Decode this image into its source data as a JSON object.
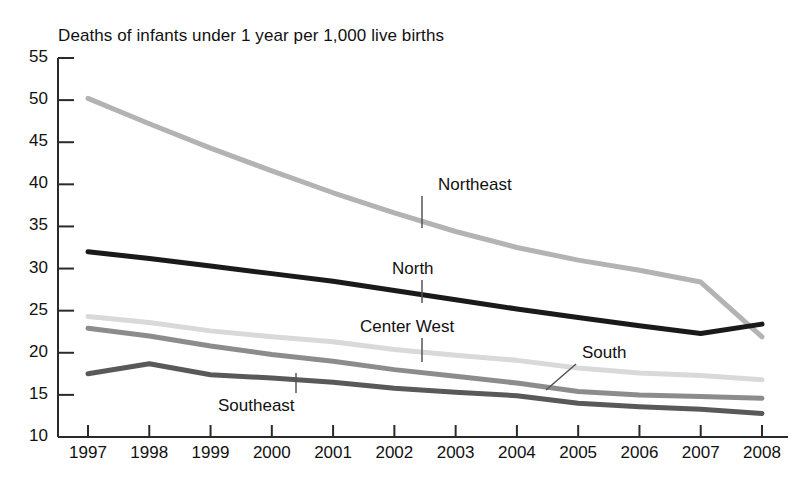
{
  "chart_data": {
    "type": "line",
    "title": "Deaths of infants under 1 year per 1,000 live births",
    "xlabel": "",
    "ylabel": "",
    "categories": [
      "1997",
      "1998",
      "1999",
      "2000",
      "2001",
      "2002",
      "2003",
      "2004",
      "2005",
      "2006",
      "2007",
      "2008"
    ],
    "x": [
      1997,
      1998,
      1999,
      2000,
      2001,
      2002,
      2003,
      2004,
      2005,
      2006,
      2007,
      2008
    ],
    "ylim": [
      10,
      55
    ],
    "xlim": [
      1997,
      2008
    ],
    "yticks": [
      "55",
      "50",
      "45",
      "40",
      "35",
      "30",
      "25",
      "20",
      "15",
      "10"
    ],
    "ytick_values": [
      55,
      50,
      45,
      40,
      35,
      30,
      25,
      20,
      15,
      10
    ],
    "grid": false,
    "legend": "inline-labels",
    "series": [
      {
        "name": "Northeast",
        "color": "#b3b3b3",
        "values": [
          50.2,
          47.2,
          44.3,
          41.6,
          39.0,
          36.6,
          34.4,
          32.5,
          31.0,
          29.8,
          28.4,
          21.9
        ],
        "label_x": 438,
        "label_y": 175,
        "leader": {
          "x1": 422,
          "y1": 196,
          "x2": 422,
          "y2": 228
        }
      },
      {
        "name": "North",
        "color": "#1a1a1a",
        "values": [
          32.0,
          31.2,
          30.3,
          29.4,
          28.5,
          27.4,
          26.3,
          25.2,
          24.2,
          23.2,
          22.3,
          23.4
        ],
        "label_x": 392,
        "label_y": 259,
        "leader": {
          "x1": 422,
          "y1": 280,
          "x2": 422,
          "y2": 303
        }
      },
      {
        "name": "Center West",
        "color": "#d9d9d9",
        "values": [
          24.3,
          23.6,
          22.6,
          21.9,
          21.3,
          20.4,
          19.7,
          19.1,
          18.2,
          17.6,
          17.3,
          16.8
        ],
        "label_x": 360,
        "label_y": 317,
        "leader": {
          "x1": 422,
          "y1": 338,
          "x2": 422,
          "y2": 362
        }
      },
      {
        "name": "South",
        "color": "#8c8c8c",
        "values": [
          22.9,
          22.0,
          20.8,
          19.8,
          19.0,
          18.0,
          17.2,
          16.4,
          15.4,
          15.0,
          14.8,
          14.6
        ],
        "label_x": 582,
        "label_y": 343,
        "leader": {
          "x1": 576,
          "y1": 364,
          "x2": 546,
          "y2": 390
        }
      },
      {
        "name": "Southeast",
        "color": "#595959",
        "values": [
          17.5,
          18.7,
          17.4,
          17.0,
          16.5,
          15.8,
          15.3,
          14.9,
          14.0,
          13.6,
          13.3,
          12.8
        ],
        "label_x": 218,
        "label_y": 396,
        "leader": {
          "x1": 296,
          "y1": 393,
          "x2": 296,
          "y2": 373
        }
      }
    ]
  },
  "axes": {
    "title_text": "Deaths of infants under 1 year per 1,000 live births"
  }
}
